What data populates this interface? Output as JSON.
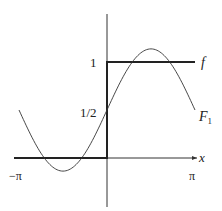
{
  "figure": {
    "labels": {
      "f": "f",
      "F1": "F",
      "F1_sub": "1",
      "x": "x",
      "y_one": "1",
      "y_half": "1/2",
      "x_neg_pi": "−π",
      "x_pi": "π"
    },
    "colors": {
      "ink": "#222222",
      "background": "#ffffff"
    }
  },
  "chart_data": {
    "type": "line",
    "title": "",
    "xlabel": "x",
    "ylabel": "",
    "xlim": [
      -3.14159,
      3.14159
    ],
    "ylim": [
      -0.5,
      1.5
    ],
    "x_ticks": [
      "−π",
      "π"
    ],
    "y_ticks": [
      "1/2",
      "1"
    ],
    "series": [
      {
        "name": "f",
        "description": "step function: 0 for x<0, 1 for x>0",
        "x": [
          -3.14159,
          0,
          0,
          3.14159
        ],
        "y": [
          0,
          0,
          1,
          1
        ]
      },
      {
        "name": "F1",
        "description": "first Fourier partial sum: 1/2 + (2/π) sin x",
        "x": [
          -3.14159,
          -2.356,
          -1.571,
          -0.785,
          0,
          0.785,
          1.571,
          2.356,
          3.14159
        ],
        "y": [
          0.5,
          0.05,
          -0.137,
          0.05,
          0.5,
          0.95,
          1.137,
          0.95,
          0.5
        ]
      }
    ],
    "grid": false,
    "legend": "inline labels at right end of curves"
  }
}
